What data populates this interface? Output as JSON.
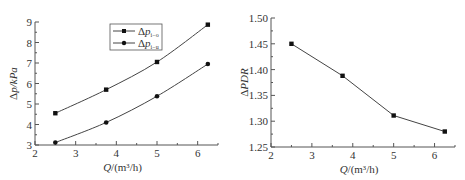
{
  "chart_data": [
    {
      "type": "line",
      "title": "",
      "xlabel": "Q/(m³/h)",
      "ylabel": "Δp/kPa",
      "xlim": [
        2,
        6.5
      ],
      "ylim": [
        3,
        9
      ],
      "x_ticks": [
        "2",
        "3",
        "4",
        "5",
        "6"
      ],
      "y_ticks": [
        "3",
        "4",
        "5",
        "6",
        "7",
        "8",
        "9"
      ],
      "grid": false,
      "legend_position": "top-center",
      "x": [
        2.5,
        3.75,
        5.0,
        6.25
      ],
      "series": [
        {
          "name": "Δp_i−o",
          "marker": "square",
          "values": [
            4.55,
            5.7,
            7.05,
            8.87
          ]
        },
        {
          "name": "Δp_i−u",
          "marker": "circle",
          "values": [
            3.12,
            4.1,
            5.38,
            6.95
          ]
        }
      ]
    },
    {
      "type": "line",
      "title": "",
      "xlabel": "Q/(m³/h)",
      "ylabel": "ΔPDR",
      "xlim": [
        2,
        6.5
      ],
      "ylim": [
        1.25,
        1.5
      ],
      "x_ticks": [
        "2",
        "3",
        "4",
        "5",
        "6"
      ],
      "y_ticks": [
        "1.25",
        "1.30",
        "1.35",
        "1.40",
        "1.45",
        "1.50"
      ],
      "grid": false,
      "x": [
        2.5,
        3.75,
        5.0,
        6.25
      ],
      "series": [
        {
          "name": "ΔPDR",
          "marker": "square",
          "values": [
            1.45,
            1.388,
            1.311,
            1.28
          ]
        }
      ]
    }
  ],
  "left": {
    "xlabel_main": "Q",
    "xlabel_rest": "/(m³/h)",
    "ylabel": "Δp/kPa",
    "legend": [
      {
        "main": "Δp",
        "sub": "i−o"
      },
      {
        "main": "Δp",
        "sub": "i−u"
      }
    ]
  },
  "right": {
    "xlabel_main": "Q",
    "xlabel_rest": "/(m³/h)",
    "ylabel": "ΔPDR"
  },
  "colors": {
    "line": "#444444",
    "marker": "#111111",
    "axis": "#555555"
  }
}
